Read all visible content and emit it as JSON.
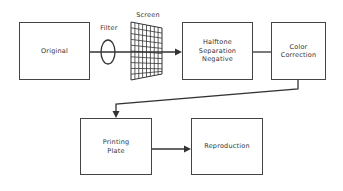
{
  "diagram": {
    "type": "flowchart",
    "nodes": [
      {
        "id": "original",
        "label": "Original"
      },
      {
        "id": "filter",
        "label": "Filter",
        "shape": "lens"
      },
      {
        "id": "screen",
        "label": "Screen",
        "shape": "grid"
      },
      {
        "id": "halftone",
        "label": "Halftone\nSeparation\nNegative"
      },
      {
        "id": "color_correction",
        "label": "Color\nCorrection"
      },
      {
        "id": "printing_plate",
        "label": "Printing\nPlate"
      },
      {
        "id": "reproduction",
        "label": "Reproduction"
      }
    ],
    "edges": [
      {
        "from": "original",
        "to": "halftone",
        "via": [
          "filter",
          "screen"
        ]
      },
      {
        "from": "halftone",
        "to": "color_correction"
      },
      {
        "from": "color_correction",
        "to": "printing_plate"
      },
      {
        "from": "printing_plate",
        "to": "reproduction"
      }
    ]
  },
  "labels": {
    "original": "Original",
    "filter": "Filter",
    "screen": "Screen",
    "halftone": "Halftone\nSeparation\nNegative",
    "color_correction": "Color\nCorrection",
    "printing_plate": "Printing\nPlate",
    "reproduction": "Reproduction"
  },
  "colors": {
    "line": "#333333",
    "text": "#333333",
    "background": "#ffffff"
  }
}
